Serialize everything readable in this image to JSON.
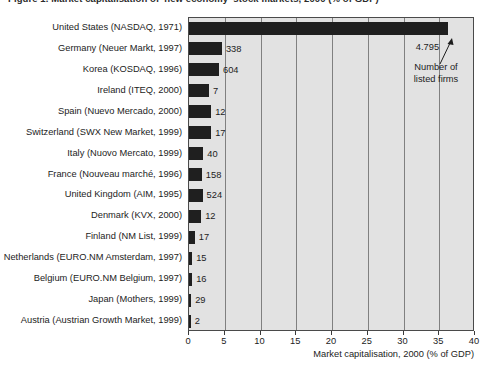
{
  "figure": {
    "caption": "Figure 1. Market capitalisation of 'new economy' stock markets, 2000 (% of GDP)"
  },
  "annotation": {
    "text": "Number of listed firms",
    "line1": "Number of",
    "line2": "listed firms",
    "arrow_target_label": "4.795"
  },
  "axis": {
    "x_title": "Market capitalisation, 2000 (% of GDP)",
    "x_ticks": [
      "0",
      "5",
      "10",
      "15",
      "20",
      "25",
      "30",
      "35",
      "40"
    ]
  },
  "colors": {
    "bar": "#1f1f1f",
    "plot_background": "#e2e2e2",
    "gridline": "#808080",
    "text": "#1c1c1c"
  },
  "chart_data": {
    "type": "bar",
    "orientation": "horizontal",
    "title": "Market capitalisation of 'new economy' stock markets, 2000 (% of GDP)",
    "xlabel": "Market capitalisation, 2000 (% of GDP)",
    "ylabel": "",
    "xlim": [
      0,
      40
    ],
    "xticks": [
      0,
      5,
      10,
      15,
      20,
      25,
      30,
      35,
      40
    ],
    "grid": true,
    "legend": false,
    "categories": [
      "United States (NASDAQ, 1971)",
      "Germany (Neuer Markt, 1997)",
      "Korea (KOSDAQ, 1996)",
      "Ireland (ITEQ, 2000)",
      "Spain (Nuevo Mercado, 2000)",
      "Switzerland (SWX New Market, 1999)",
      "Italy (Nuovo Mercato, 1999)",
      "France (Nouveau marché, 1996)",
      "United Kingdom (AIM, 1995)",
      "Denmark (KVX, 2000)",
      "Finland (NM List, 1999)",
      "Netherlands (EURO.NM Amsterdam, 1997)",
      "Belgium (EURO.NM Belgium, 1997)",
      "Japan (Mothers, 1999)",
      "Austria (Austrian Growth Market, 1999)"
    ],
    "values": [
      36.2,
      4.6,
      4.2,
      2.8,
      3.1,
      3.1,
      2.0,
      1.8,
      1.9,
      1.7,
      0.8,
      0.45,
      0.45,
      0.3,
      0.25
    ],
    "data_labels": [
      "4.795",
      "338",
      "604",
      "7",
      "12",
      "17",
      "40",
      "158",
      "524",
      "12",
      "17",
      "15",
      "16",
      "29",
      "2"
    ],
    "data_label_meaning": "Number of listed firms"
  }
}
